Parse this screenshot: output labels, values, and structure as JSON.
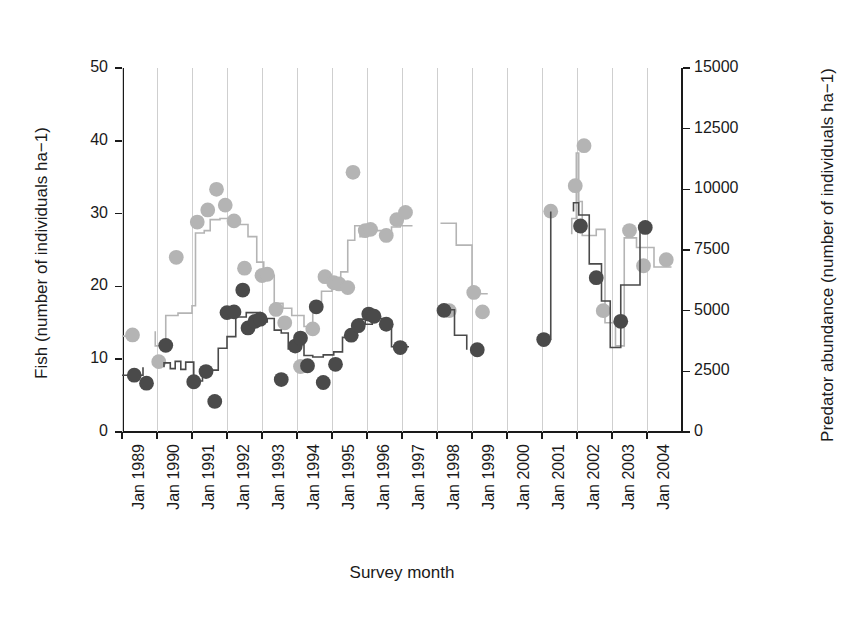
{
  "chart_data": {
    "type": "line",
    "title": "",
    "xlabel": "Survey month",
    "ylabel": "Fish (number of individuals ha−1)",
    "y2label": "Predator abundance (number of individuals ha−1)",
    "grid": true,
    "legend": "none",
    "xlim": [
      1989.0,
      2005.0
    ],
    "ylim": [
      0,
      50
    ],
    "y2lim": [
      0,
      15000
    ],
    "xtick_labels": [
      "Jan 1989",
      "Jan 1990",
      "Jan 1991",
      "Jan 1992",
      "Jan 1993",
      "Jan 1994",
      "Jan 1995",
      "Jan 1996",
      "Jan 1997",
      "Jan 1998",
      "Jan 1999",
      "Jan 2000",
      "Jan 2001",
      "Jan 2002",
      "Jan 2003",
      "Jan 2004"
    ],
    "xtick_values": [
      1989,
      1990,
      1991,
      1992,
      1993,
      1994,
      1995,
      1996,
      1997,
      1998,
      1999,
      2000,
      2001,
      2002,
      2003,
      2004
    ],
    "ytick_labels_left": [
      "0",
      "10",
      "20",
      "30",
      "40",
      "50"
    ],
    "ytick_values_left": [
      0,
      10,
      20,
      30,
      40,
      50
    ],
    "ytick_labels_right": [
      "0",
      "2500",
      "5000",
      "7500",
      "10000",
      "12500",
      "15000"
    ],
    "ytick_values_right": [
      0,
      2500,
      5000,
      7500,
      10000,
      12500,
      15000
    ],
    "colors": {
      "fish": "#4a4a4a",
      "predator": "#b4b4b4",
      "axis": "#1a1a1a",
      "grid": "#cfcfcf",
      "background": "#ffffff"
    },
    "series": [
      {
        "name": "Predator abundance",
        "axis": "right",
        "marker": "filled-circle",
        "color": "#b4b4b4",
        "line_style": "step",
        "units": "number of individuals ha-1",
        "points": [
          {
            "x": 1989.3,
            "y": 4000
          },
          {
            "x": 1990.05,
            "y": 2900
          },
          {
            "x": 1990.55,
            "y": 7200
          },
          {
            "x": 1991.15,
            "y": 8650
          },
          {
            "x": 1991.45,
            "y": 9150
          },
          {
            "x": 1991.7,
            "y": 10000
          },
          {
            "x": 1991.95,
            "y": 9350
          },
          {
            "x": 1992.2,
            "y": 8700
          },
          {
            "x": 1992.5,
            "y": 6750
          },
          {
            "x": 1993.0,
            "y": 6450
          },
          {
            "x": 1993.15,
            "y": 6500
          },
          {
            "x": 1993.4,
            "y": 5050
          },
          {
            "x": 1993.65,
            "y": 4500
          },
          {
            "x": 1994.1,
            "y": 2700
          },
          {
            "x": 1994.45,
            "y": 4250
          },
          {
            "x": 1994.8,
            "y": 6400
          },
          {
            "x": 1995.05,
            "y": 6150
          },
          {
            "x": 1995.2,
            "y": 6100
          },
          {
            "x": 1995.45,
            "y": 5950
          },
          {
            "x": 1995.6,
            "y": 10700
          },
          {
            "x": 1995.95,
            "y": 8300
          },
          {
            "x": 1996.1,
            "y": 8350
          },
          {
            "x": 1996.55,
            "y": 8100
          },
          {
            "x": 1996.85,
            "y": 8750
          },
          {
            "x": 1997.1,
            "y": 9050
          },
          {
            "x": 1998.35,
            "y": 5000
          },
          {
            "x": 1999.05,
            "y": 5750
          },
          {
            "x": 1999.3,
            "y": 4950
          },
          {
            "x": 2001.25,
            "y": 9100
          },
          {
            "x": 2001.95,
            "y": 10150
          },
          {
            "x": 2002.2,
            "y": 11800
          },
          {
            "x": 2002.75,
            "y": 5000
          },
          {
            "x": 2003.5,
            "y": 8300
          },
          {
            "x": 2003.9,
            "y": 6850
          },
          {
            "x": 2004.55,
            "y": 7100
          }
        ],
        "line": [
          {
            "x": 1989.0,
            "y": 3950
          },
          {
            "x": 1989.35,
            "y": 3950
          },
          {
            "x": 1989.35,
            "y": 4150
          },
          {
            "x": 1989.95,
            "y": 4150
          },
          {
            "x": 1989.95,
            "y": 3550
          },
          {
            "x": 1990.25,
            "y": 3550
          },
          {
            "x": 1990.25,
            "y": 4800
          },
          {
            "x": 1990.6,
            "y": 4800
          },
          {
            "x": 1990.6,
            "y": 4900
          },
          {
            "x": 1991.0,
            "y": 4900
          },
          {
            "x": 1991.0,
            "y": 5200
          },
          {
            "x": 1991.1,
            "y": 5200
          },
          {
            "x": 1991.1,
            "y": 8200
          },
          {
            "x": 1991.35,
            "y": 8200
          },
          {
            "x": 1991.35,
            "y": 8300
          },
          {
            "x": 1991.52,
            "y": 8300
          },
          {
            "x": 1991.52,
            "y": 8750
          },
          {
            "x": 1991.8,
            "y": 8750
          },
          {
            "x": 1991.8,
            "y": 8800
          },
          {
            "x": 1992.35,
            "y": 8800
          },
          {
            "x": 1992.35,
            "y": 8550
          },
          {
            "x": 1992.6,
            "y": 8550
          },
          {
            "x": 1992.6,
            "y": 8050
          },
          {
            "x": 1992.85,
            "y": 8050
          },
          {
            "x": 1992.85,
            "y": 7000
          },
          {
            "x": 1993.05,
            "y": 7000
          },
          {
            "x": 1993.05,
            "y": 6450
          },
          {
            "x": 1993.35,
            "y": 6450
          },
          {
            "x": 1993.35,
            "y": 5300
          },
          {
            "x": 1993.6,
            "y": 5300
          },
          {
            "x": 1993.6,
            "y": 5100
          },
          {
            "x": 1993.85,
            "y": 5100
          },
          {
            "x": 1993.85,
            "y": 4800
          },
          {
            "x": 1994.2,
            "y": 4800
          },
          {
            "x": 1994.2,
            "y": 4350
          },
          {
            "x": 1994.45,
            "y": 4350
          },
          {
            "x": 1994.45,
            "y": 5250
          },
          {
            "x": 1994.7,
            "y": 5250
          },
          {
            "x": 1994.7,
            "y": 5800
          },
          {
            "x": 1995.0,
            "y": 5800
          },
          {
            "x": 1995.0,
            "y": 6300
          },
          {
            "x": 1995.25,
            "y": 6300
          },
          {
            "x": 1995.25,
            "y": 6600
          },
          {
            "x": 1995.45,
            "y": 6600
          },
          {
            "x": 1995.45,
            "y": 7900
          },
          {
            "x": 1995.65,
            "y": 7900
          },
          {
            "x": 1995.65,
            "y": 8500
          },
          {
            "x": 1995.8,
            "y": 8500
          },
          {
            "x": 1995.8,
            "y": 8050
          },
          {
            "x": 1996.0,
            "y": 8050
          },
          {
            "x": 1996.0,
            "y": 8300
          },
          {
            "x": 1996.45,
            "y": 8300
          },
          {
            "x": 1996.45,
            "y": 8200
          },
          {
            "x": 1996.7,
            "y": 8200
          },
          {
            "x": 1996.7,
            "y": 8450
          },
          {
            "x": 1996.95,
            "y": 8450
          },
          {
            "x": 1996.95,
            "y": 8500
          },
          {
            "x": 1997.3,
            "y": 8500
          },
          {
            "x": 1998.1,
            "y": 8600
          },
          {
            "x": 1998.55,
            "y": 8600
          },
          {
            "x": 1998.55,
            "y": 7700
          },
          {
            "x": 1999.0,
            "y": 7700
          },
          {
            "x": 1999.0,
            "y": 5700
          },
          {
            "x": 1999.45,
            "y": 5700
          },
          {
            "x": 2001.0,
            "y": 8150
          },
          {
            "x": 2001.85,
            "y": 8150
          },
          {
            "x": 2001.85,
            "y": 8800
          },
          {
            "x": 2001.98,
            "y": 8800
          },
          {
            "x": 2001.98,
            "y": 11500
          },
          {
            "x": 2002.05,
            "y": 11500
          },
          {
            "x": 2002.05,
            "y": 9500
          },
          {
            "x": 2002.15,
            "y": 9500
          },
          {
            "x": 2002.15,
            "y": 8100
          },
          {
            "x": 2002.55,
            "y": 8100
          },
          {
            "x": 2002.55,
            "y": 8350
          },
          {
            "x": 2002.8,
            "y": 8350
          },
          {
            "x": 2002.8,
            "y": 4500
          },
          {
            "x": 2003.1,
            "y": 4500
          },
          {
            "x": 2003.1,
            "y": 3550
          },
          {
            "x": 2003.35,
            "y": 3550
          },
          {
            "x": 2003.35,
            "y": 8000
          },
          {
            "x": 2003.7,
            "y": 8000
          },
          {
            "x": 2003.7,
            "y": 7600
          },
          {
            "x": 2004.2,
            "y": 7600
          },
          {
            "x": 2004.2,
            "y": 6800
          },
          {
            "x": 2004.7,
            "y": 6800
          }
        ]
      },
      {
        "name": "Fish",
        "axis": "left",
        "marker": "filled-circle",
        "color": "#4a4a4a",
        "line_style": "step",
        "units": "number of individuals ha-1",
        "points": [
          {
            "x": 1989.35,
            "y": 7.8
          },
          {
            "x": 1989.7,
            "y": 6.7
          },
          {
            "x": 1990.25,
            "y": 11.9
          },
          {
            "x": 1991.05,
            "y": 6.9
          },
          {
            "x": 1991.4,
            "y": 8.3
          },
          {
            "x": 1991.65,
            "y": 4.2
          },
          {
            "x": 1992.0,
            "y": 16.4
          },
          {
            "x": 1992.2,
            "y": 16.5
          },
          {
            "x": 1992.45,
            "y": 19.5
          },
          {
            "x": 1992.6,
            "y": 14.3
          },
          {
            "x": 1992.8,
            "y": 15.2
          },
          {
            "x": 1992.95,
            "y": 15.5
          },
          {
            "x": 1993.55,
            "y": 7.2
          },
          {
            "x": 1993.95,
            "y": 11.8
          },
          {
            "x": 1994.1,
            "y": 12.9
          },
          {
            "x": 1994.3,
            "y": 9.1
          },
          {
            "x": 1994.55,
            "y": 17.2
          },
          {
            "x": 1994.75,
            "y": 6.8
          },
          {
            "x": 1995.1,
            "y": 9.3
          },
          {
            "x": 1995.55,
            "y": 13.3
          },
          {
            "x": 1995.75,
            "y": 14.6
          },
          {
            "x": 1996.05,
            "y": 16.2
          },
          {
            "x": 1996.2,
            "y": 15.9
          },
          {
            "x": 1996.55,
            "y": 14.8
          },
          {
            "x": 1996.95,
            "y": 11.6
          },
          {
            "x": 1998.2,
            "y": 16.7
          },
          {
            "x": 1999.15,
            "y": 11.3
          },
          {
            "x": 2001.05,
            "y": 12.7
          },
          {
            "x": 2002.1,
            "y": 28.3
          },
          {
            "x": 2002.55,
            "y": 21.2
          },
          {
            "x": 2003.25,
            "y": 15.2
          },
          {
            "x": 2003.95,
            "y": 28.1
          }
        ],
        "line": [
          {
            "x": 1989.0,
            "y": 7.8
          },
          {
            "x": 1989.6,
            "y": 7.8
          },
          {
            "x": 1989.6,
            "y": 8.9
          },
          {
            "x": 1990.2,
            "y": 8.9
          },
          {
            "x": 1990.2,
            "y": 9.5
          },
          {
            "x": 1990.38,
            "y": 9.5
          },
          {
            "x": 1990.38,
            "y": 8.7
          },
          {
            "x": 1990.52,
            "y": 8.7
          },
          {
            "x": 1990.52,
            "y": 9.7
          },
          {
            "x": 1990.68,
            "y": 9.7
          },
          {
            "x": 1990.68,
            "y": 8.6
          },
          {
            "x": 1990.82,
            "y": 8.6
          },
          {
            "x": 1990.82,
            "y": 9.6
          },
          {
            "x": 1991.05,
            "y": 9.6
          },
          {
            "x": 1991.05,
            "y": 7.0
          },
          {
            "x": 1991.3,
            "y": 7.0
          },
          {
            "x": 1991.3,
            "y": 8.8
          },
          {
            "x": 1991.5,
            "y": 8.8
          },
          {
            "x": 1991.5,
            "y": 8.5
          },
          {
            "x": 1991.75,
            "y": 8.5
          },
          {
            "x": 1991.75,
            "y": 11.5
          },
          {
            "x": 1992.0,
            "y": 11.5
          },
          {
            "x": 1992.0,
            "y": 13.1
          },
          {
            "x": 1992.25,
            "y": 13.1
          },
          {
            "x": 1992.25,
            "y": 15.8
          },
          {
            "x": 1992.55,
            "y": 15.8
          },
          {
            "x": 1992.55,
            "y": 16.4
          },
          {
            "x": 1992.95,
            "y": 16.4
          },
          {
            "x": 1992.95,
            "y": 15.1
          },
          {
            "x": 1993.15,
            "y": 15.1
          },
          {
            "x": 1993.15,
            "y": 15.6
          },
          {
            "x": 1993.35,
            "y": 15.6
          },
          {
            "x": 1993.35,
            "y": 14.0
          },
          {
            "x": 1993.55,
            "y": 14.0
          },
          {
            "x": 1993.55,
            "y": 13.6
          },
          {
            "x": 1993.75,
            "y": 13.6
          },
          {
            "x": 1993.75,
            "y": 11.4
          },
          {
            "x": 1994.0,
            "y": 11.4
          },
          {
            "x": 1994.0,
            "y": 12.0
          },
          {
            "x": 1994.2,
            "y": 12.0
          },
          {
            "x": 1994.2,
            "y": 10.5
          },
          {
            "x": 1994.45,
            "y": 10.5
          },
          {
            "x": 1994.45,
            "y": 10.3
          },
          {
            "x": 1994.75,
            "y": 10.3
          },
          {
            "x": 1994.75,
            "y": 10.6
          },
          {
            "x": 1995.05,
            "y": 10.6
          },
          {
            "x": 1995.05,
            "y": 11.0
          },
          {
            "x": 1995.3,
            "y": 11.0
          },
          {
            "x": 1995.3,
            "y": 13.0
          },
          {
            "x": 1995.55,
            "y": 13.0
          },
          {
            "x": 1995.55,
            "y": 13.8
          },
          {
            "x": 1995.75,
            "y": 13.8
          },
          {
            "x": 1995.75,
            "y": 15.5
          },
          {
            "x": 1995.95,
            "y": 15.5
          },
          {
            "x": 1995.95,
            "y": 14.8
          },
          {
            "x": 1996.15,
            "y": 14.8
          },
          {
            "x": 1996.15,
            "y": 15.6
          },
          {
            "x": 1996.45,
            "y": 15.6
          },
          {
            "x": 1996.45,
            "y": 15.3
          },
          {
            "x": 1996.7,
            "y": 15.3
          },
          {
            "x": 1996.7,
            "y": 11.7
          },
          {
            "x": 1997.2,
            "y": 11.7
          },
          {
            "x": 1998.0,
            "y": 16.8
          },
          {
            "x": 1998.5,
            "y": 16.8
          },
          {
            "x": 1998.5,
            "y": 13.3
          },
          {
            "x": 1998.85,
            "y": 13.3
          },
          {
            "x": 1998.85,
            "y": 11.3
          },
          {
            "x": 1999.45,
            "y": 11.3
          },
          {
            "x": 2000.85,
            "y": 12.7
          },
          {
            "x": 2001.25,
            "y": 12.7
          },
          {
            "x": 2001.25,
            "y": 30.3
          },
          {
            "x": 2001.9,
            "y": 30.3
          },
          {
            "x": 2001.9,
            "y": 31.5
          },
          {
            "x": 2002.05,
            "y": 31.5
          },
          {
            "x": 2002.05,
            "y": 29.8
          },
          {
            "x": 2002.35,
            "y": 29.8
          },
          {
            "x": 2002.35,
            "y": 23.1
          },
          {
            "x": 2002.7,
            "y": 23.1
          },
          {
            "x": 2002.7,
            "y": 18.0
          },
          {
            "x": 2002.95,
            "y": 18.0
          },
          {
            "x": 2002.95,
            "y": 11.6
          },
          {
            "x": 2003.25,
            "y": 11.6
          },
          {
            "x": 2003.25,
            "y": 20.2
          },
          {
            "x": 2003.8,
            "y": 20.2
          },
          {
            "x": 2003.8,
            "y": 28.1
          },
          {
            "x": 2004.7,
            "y": 28.1
          }
        ]
      }
    ]
  }
}
